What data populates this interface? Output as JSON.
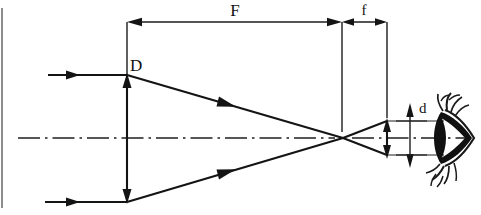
{
  "figure": {
    "kind": "optical-ray-diagram",
    "background_color": "#ffffff",
    "line_color": "#141414",
    "width": 481,
    "height": 215
  },
  "labels": {
    "objective_diameter": "D",
    "focal_length_objective": "F",
    "focal_length_eyepiece": "f",
    "exit_pupil_diameter": "d"
  },
  "label_positions": {
    "objective_diameter": {
      "x": 130,
      "y": 70
    },
    "focal_length_objective": {
      "x": 235,
      "y": 18
    },
    "focal_length_eyepiece": {
      "x": 363,
      "y": 17
    },
    "exit_pupil_diameter": {
      "x": 416,
      "y": 113
    }
  },
  "geometry": {
    "optical_axis_y": 138,
    "optical_axis_x1": 18,
    "optical_axis_x2": 466,
    "objective_x": 127,
    "objective_top_y": 75,
    "objective_bottom_y": 202,
    "focal_point_x": 343,
    "focal_point_y": 138,
    "eyepiece_x": 387,
    "dim_line_y": 22,
    "F_start_x": 127,
    "F_end_x": 342,
    "f_start_x": 342,
    "f_end_x": 387,
    "exit_pupil_top_y": 120,
    "exit_pupil_bottom_y": 157,
    "d_dimension_x": 410,
    "d_top_y": 103,
    "d_bottom_y": 165,
    "eye_center_x": 452,
    "eye_center_y": 138
  },
  "rays": {
    "incoming_top": {
      "y": 75,
      "x1": 48,
      "x2": 127,
      "arrow_x": 75
    },
    "incoming_bottom": {
      "y": 202,
      "x1": 45,
      "x2": 127,
      "arrow_x": 75
    },
    "converge_top_arrow": {
      "x": 225,
      "y": 103
    },
    "converge_bottom_arrow": {
      "x": 225,
      "y": 174
    }
  }
}
